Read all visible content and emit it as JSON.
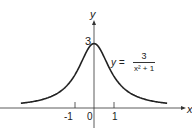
{
  "chart_data": {
    "type": "line",
    "title": "",
    "xlabel": "x",
    "ylabel": "y",
    "equation": {
      "lhs": "y =",
      "numerator": "3",
      "denominator": "x² + 1"
    },
    "function": "y = 3/(x^2+1)",
    "x_ticks": [
      "-1",
      "0",
      "1"
    ],
    "y_ticks": [
      "3"
    ],
    "xlim": [
      -3.7,
      3.7
    ],
    "ylim": [
      -0.5,
      3.6
    ],
    "grid": false,
    "series": [
      {
        "name": "y = 3/(x^2+1)",
        "x": [
          -3.5,
          -3,
          -2.5,
          -2,
          -1.5,
          -1,
          -0.5,
          0,
          0.5,
          1,
          1.5,
          2,
          2.5,
          3,
          3.5
        ],
        "y": [
          0.22,
          0.3,
          0.41,
          0.6,
          0.92,
          1.5,
          2.4,
          3,
          2.4,
          1.5,
          0.92,
          0.6,
          0.41,
          0.3,
          0.22
        ]
      }
    ]
  }
}
